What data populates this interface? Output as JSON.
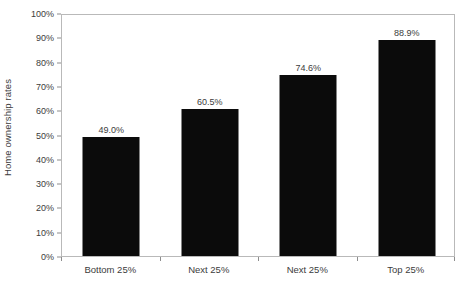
{
  "chart_data": {
    "type": "bar",
    "title": "",
    "subtitle": "",
    "xlabel": "",
    "ylabel": "Home ownership rates",
    "categories": [
      "Bottom 25%",
      "Next 25%",
      "Next 25%",
      "Top 25%"
    ],
    "values": [
      49.0,
      60.5,
      74.6,
      88.9
    ],
    "value_labels": [
      "49.0%",
      "60.5%",
      "74.6%",
      "88.9%"
    ],
    "ylim": [
      0,
      100
    ],
    "ytick_values": [
      0,
      10,
      20,
      30,
      40,
      50,
      60,
      70,
      80,
      90,
      100
    ],
    "ytick_labels": [
      "0%",
      "10%",
      "20%",
      "30%",
      "40%",
      "50%",
      "60%",
      "70%",
      "80%",
      "90%",
      "100%"
    ],
    "grid": false,
    "legend": false,
    "legend_position": "none",
    "bar_color": "#0b0b0b",
    "axis_color": "#b9b9b9",
    "tick_color": "#8d8d8d",
    "text_color": "#3c3c3c",
    "background_color": "#ffffff"
  }
}
